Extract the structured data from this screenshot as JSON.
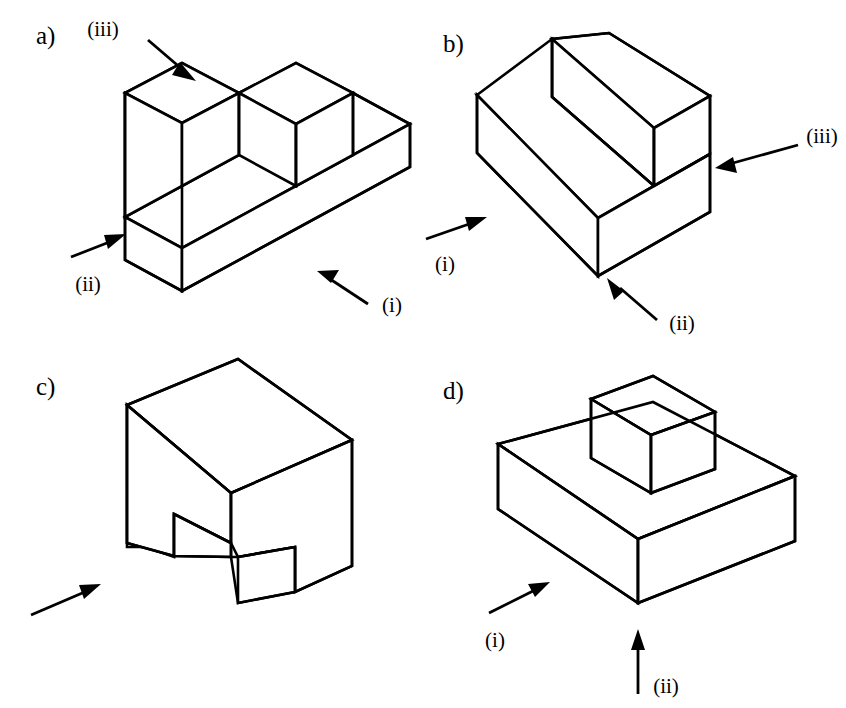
{
  "figure": {
    "background_color": "#ffffff",
    "line_color": "#000000",
    "panel_count": 4
  },
  "panels": [
    {
      "id": "a",
      "letter": "a)",
      "shape_name": "L-shaped base with two rectangular bosses",
      "callouts": [
        {
          "label": "(iii)",
          "direction": "down-right",
          "target": "top-front-face"
        },
        {
          "label": "(ii)",
          "direction": "up-right",
          "target": "left-side-face"
        },
        {
          "label": "(i)",
          "direction": "up-left",
          "target": "front-face"
        }
      ]
    },
    {
      "id": "b",
      "letter": "b)",
      "shape_name": "Two-step staircase block",
      "callouts": [
        {
          "label": "(iii)",
          "direction": "left",
          "target": "right-end-face"
        },
        {
          "label": "(i)",
          "direction": "up-right",
          "target": "left-front-face"
        },
        {
          "label": "(ii)",
          "direction": "up-left",
          "target": "front-face"
        }
      ]
    },
    {
      "id": "c",
      "letter": "c)",
      "shape_name": "Cube with rectangular through-slot in lower front",
      "callouts": [
        {
          "label": "",
          "direction": "up-right",
          "target": "front-lower-face"
        }
      ]
    },
    {
      "id": "d",
      "letter": "d)",
      "shape_name": "Rectangular slab with centred cubic boss",
      "callouts": [
        {
          "label": "(i)",
          "direction": "up-right",
          "target": "left-front-face"
        },
        {
          "label": "(ii)",
          "direction": "up",
          "target": "front-bottom-corner"
        }
      ]
    }
  ]
}
